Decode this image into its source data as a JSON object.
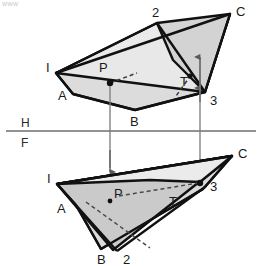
{
  "figure": {
    "corner_note": "www",
    "reference_line": {
      "upper_label": "H",
      "lower_label": "F",
      "y": 130,
      "x_start": 6,
      "x_end": 256,
      "upper_label_pos": {
        "x": 24,
        "y": 126
      },
      "lower_label_pos": {
        "x": 24,
        "y": 146
      }
    },
    "colors": {
      "outline": "#111111",
      "light_fill": "#e9e9e9",
      "mid_fill": "#d8d8d8",
      "dark_fill": "#c9c9c9",
      "hidden_line": "#4a4a4a",
      "projector": "#7a7a7a",
      "reference_line": "#6e6e6e",
      "label_text": "#1a1a1a",
      "background": "#ffffff"
    },
    "top_view": {
      "name": "H (top) view",
      "triangle_123": {
        "label": "triangle 1-2-3",
        "points": "56,73 157,23 230,14 205,92 196,86",
        "vertices": [
          {
            "name": "2",
            "x": 157,
            "y": 23
          },
          {
            "name": "C",
            "x": 230,
            "y": 14
          },
          {
            "name": "3",
            "x": 205,
            "y": 92
          }
        ]
      },
      "quad_IABC": {
        "label": "quadrilateral I-A-B-C",
        "points": "56,73 230,14 205,92 135,110",
        "vertices": [
          {
            "name": "I",
            "x": 56,
            "y": 73
          },
          {
            "name": "A",
            "x": 73,
            "y": 94
          },
          {
            "name": "B",
            "x": 135,
            "y": 110
          },
          {
            "name": "C",
            "x": 230,
            "y": 14
          }
        ]
      },
      "labels": [
        {
          "text": "I",
          "x": 47,
          "y": 70
        },
        {
          "text": "A",
          "x": 60,
          "y": 96
        },
        {
          "text": "B",
          "x": 133,
          "y": 123
        },
        {
          "text": "C",
          "x": 235,
          "y": 14
        },
        {
          "text": "2",
          "x": 155,
          "y": 14
        },
        {
          "text": "3",
          "x": 213,
          "y": 101
        },
        {
          "text": "P",
          "x": 103,
          "y": 68
        },
        {
          "text": "T",
          "x": 184,
          "y": 81
        }
      ],
      "pierce_points": [
        {
          "name": "P",
          "x": 110,
          "y": 83
        },
        {
          "name": "T",
          "x": 190,
          "y": 76
        }
      ],
      "arrows": [
        {
          "name": "arrow-up-T",
          "x": 200,
          "y_tail": 88,
          "y_head": 57
        },
        {
          "name": "arrow-up-3",
          "x": 200,
          "y_tail": 100,
          "y_head": 88
        }
      ]
    },
    "front_view": {
      "name": "F (front) view",
      "triangle_123": {
        "label": "triangle 1-2-3",
        "points": "57,184 113,250 200,180 232,156",
        "vertices": [
          {
            "name": "2",
            "x": 113,
            "y": 250
          },
          {
            "name": "C",
            "x": 232,
            "y": 156
          },
          {
            "name": "3",
            "x": 205,
            "y": 186
          }
        ]
      },
      "quad_IABC": {
        "label": "quadrilateral I-A-B-C",
        "points": "57,184 232,156 203,189 101,249",
        "vertices": [
          {
            "name": "I",
            "x": 57,
            "y": 184
          },
          {
            "name": "A",
            "x": 76,
            "y": 205
          },
          {
            "name": "B",
            "x": 101,
            "y": 249
          },
          {
            "name": "C",
            "x": 232,
            "y": 156
          }
        ]
      },
      "labels": [
        {
          "text": "I",
          "x": 48,
          "y": 181
        },
        {
          "text": "A",
          "x": 60,
          "y": 209
        },
        {
          "text": "B",
          "x": 100,
          "y": 261
        },
        {
          "text": "C",
          "x": 238,
          "y": 156
        },
        {
          "text": "2",
          "x": 124,
          "y": 261
        },
        {
          "text": "3",
          "x": 213,
          "y": 187
        },
        {
          "text": "P",
          "x": 116,
          "y": 194
        },
        {
          "text": "T",
          "x": 173,
          "y": 202
        }
      ],
      "pierce_points": [
        {
          "name": "P",
          "x": 110,
          "y": 200
        },
        {
          "name": "T",
          "x": 200,
          "y": 182
        }
      ]
    },
    "projectors": [
      {
        "name": "projector-P",
        "x": 110,
        "y_start": 83,
        "y_end": 200,
        "arrow": "down"
      },
      {
        "name": "projector-T",
        "x": 200,
        "y_start": 76,
        "y_end": 182,
        "arrow": "down"
      }
    ],
    "hidden_lines": [
      {
        "name": "hidden-P-edge-top",
        "x1": 110,
        "y1": 83,
        "x2": 135,
        "y2": 74
      },
      {
        "name": "hidden-T-edge-top",
        "x1": 190,
        "y1": 76,
        "x2": 176,
        "y2": 95
      },
      {
        "name": "hidden-A-B-front",
        "x1": 83,
        "y1": 200,
        "x2": 150,
        "y2": 250
      },
      {
        "name": "hidden-P-T-front",
        "x1": 118,
        "y1": 196,
        "x2": 198,
        "y2": 184
      }
    ]
  }
}
